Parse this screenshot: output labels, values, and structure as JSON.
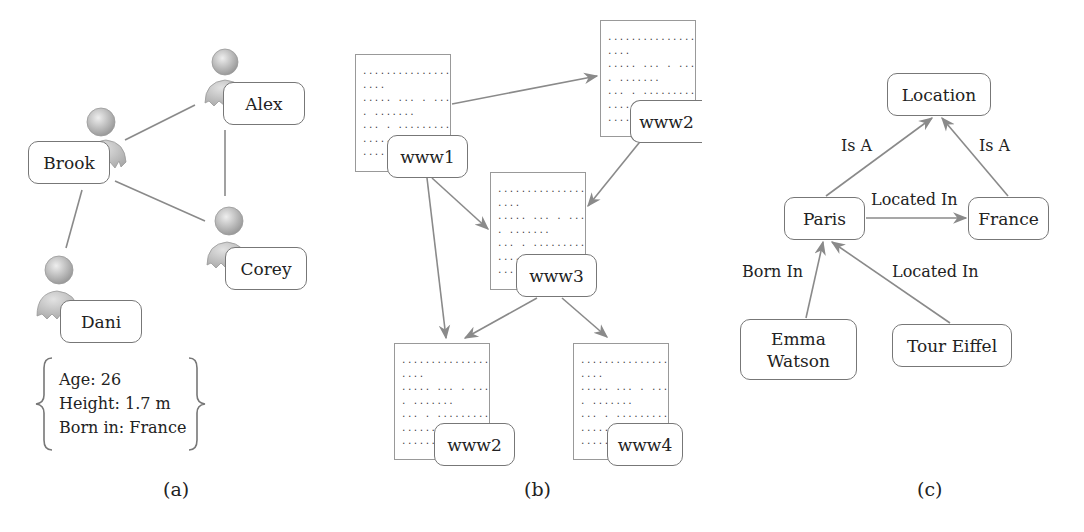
{
  "panels": {
    "a": {
      "caption": "(a)",
      "people": {
        "alex": "Alex",
        "brook": "Brook",
        "corey": "Corey",
        "dani": "Dani"
      },
      "attributes": {
        "age": "Age: 26",
        "height": "Height: 1.7 m",
        "born": "Born in: France"
      },
      "edges": [
        [
          "Brook",
          "Alex"
        ],
        [
          "Brook",
          "Corey"
        ],
        [
          "Brook",
          "Dani"
        ],
        [
          "Alex",
          "Corey"
        ]
      ]
    },
    "b": {
      "caption": "(b)",
      "pages": {
        "www1": "www1",
        "www2_top": "www2",
        "www3": "www3",
        "www2_bottom": "www2",
        "www4": "www4"
      },
      "doc_lines": "..................\n....\n..... ... . .......\n. .......\n... . .........\n..........\n..........",
      "links": [
        [
          "www1",
          "www2"
        ],
        [
          "www1",
          "www3"
        ],
        [
          "www1",
          "www2"
        ],
        [
          "www2",
          "www3"
        ],
        [
          "www3",
          "www2"
        ],
        [
          "www3",
          "www4"
        ]
      ]
    },
    "c": {
      "caption": "(c)",
      "nodes": {
        "location": "Location",
        "paris": "Paris",
        "france": "France",
        "emma": "Emma Watson",
        "tour": "Tour Eiffel"
      },
      "edge_labels": {
        "paris_isa": "Is A",
        "france_isa": "Is A",
        "paris_france": "Located In",
        "emma_paris": "Born In",
        "tour_paris": "Located In"
      }
    }
  },
  "colors": {
    "line": "#8a8a8a",
    "border": "#777777",
    "person": "#b8b8b8"
  }
}
